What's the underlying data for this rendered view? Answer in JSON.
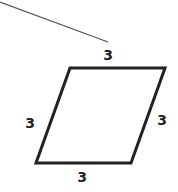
{
  "diagram": {
    "shape": "rhombus",
    "stroke_color": "#222222",
    "line_color": "#555555",
    "labels": {
      "top": "3",
      "left": "3",
      "right": "3",
      "bottom": "3"
    }
  }
}
